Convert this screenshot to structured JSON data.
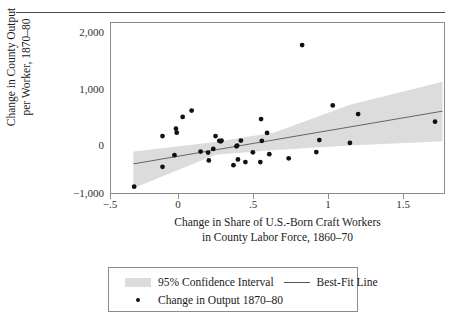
{
  "chart_data": {
    "type": "scatter",
    "title": "",
    "xlabel": "Change in Share of U.S.-Born Craft Workers in County Labor Force, 1860–70",
    "xlabel_line1": "Change in Share of U.S.-Born Craft Workers",
    "xlabel_line2": "in County Labor Force, 1860–70",
    "ylabel": "Change in County Output per Worker, 1870–80",
    "ylabel_line1": "Change in County Output",
    "ylabel_line2": "per Worker, 1870–80",
    "xlim": [
      -0.5,
      1.73
    ],
    "ylim": [
      -1120,
      2120
    ],
    "xticks": [
      -0.5,
      0,
      0.5,
      1,
      1.5
    ],
    "xticklabels": [
      "−.5",
      "0",
      ".5",
      "1",
      "1.5"
    ],
    "yticks": [
      -1000,
      0,
      1000,
      2000
    ],
    "yticklabels": [
      "−1,000",
      "0",
      "1,000",
      "2,000"
    ],
    "grid": false,
    "legend_position": "below-axes",
    "marker_color": "#111111",
    "band_color": "#dcdcdc",
    "line_color": "#555555",
    "frame_color": "#8c8c8c",
    "points": [
      {
        "x": -0.345,
        "y": -1000
      },
      {
        "x": -0.155,
        "y": -620
      },
      {
        "x": -0.155,
        "y": -35
      },
      {
        "x": -0.075,
        "y": -400
      },
      {
        "x": -0.065,
        "y": 105
      },
      {
        "x": -0.06,
        "y": 30
      },
      {
        "x": -0.02,
        "y": 330
      },
      {
        "x": 0.04,
        "y": 450
      },
      {
        "x": 0.1,
        "y": -330
      },
      {
        "x": 0.15,
        "y": -350
      },
      {
        "x": 0.155,
        "y": -500
      },
      {
        "x": 0.185,
        "y": -280
      },
      {
        "x": 0.2,
        "y": -35
      },
      {
        "x": 0.225,
        "y": -125
      },
      {
        "x": 0.235,
        "y": -135
      },
      {
        "x": 0.24,
        "y": -120
      },
      {
        "x": 0.32,
        "y": -590
      },
      {
        "x": 0.34,
        "y": -230
      },
      {
        "x": 0.345,
        "y": -215
      },
      {
        "x": 0.35,
        "y": -480
      },
      {
        "x": 0.37,
        "y": -120
      },
      {
        "x": 0.4,
        "y": -530
      },
      {
        "x": 0.45,
        "y": -345
      },
      {
        "x": 0.5,
        "y": -530
      },
      {
        "x": 0.505,
        "y": 290
      },
      {
        "x": 0.51,
        "y": -125
      },
      {
        "x": 0.545,
        "y": 25
      },
      {
        "x": 0.56,
        "y": -380
      },
      {
        "x": 0.69,
        "y": -460
      },
      {
        "x": 0.78,
        "y": 1700
      },
      {
        "x": 0.875,
        "y": -340
      },
      {
        "x": 0.895,
        "y": -110
      },
      {
        "x": 0.985,
        "y": 550
      },
      {
        "x": 1.1,
        "y": -165
      },
      {
        "x": 1.155,
        "y": 385
      },
      {
        "x": 1.67,
        "y": 240
      }
    ],
    "fit_line": {
      "x0": -0.35,
      "y0": -565,
      "x1": 1.72,
      "y1": 440
    },
    "confidence_band": {
      "upper": [
        [
          -0.35,
          -330
        ],
        [
          0.2,
          -150
        ],
        [
          0.6,
          40
        ],
        [
          1.1,
          560
        ],
        [
          1.72,
          1000
        ]
      ],
      "lower": [
        [
          -0.35,
          -1030
        ],
        [
          0.2,
          -390
        ],
        [
          0.6,
          -300
        ],
        [
          1.1,
          -215
        ],
        [
          1.72,
          -135
        ]
      ]
    }
  },
  "legend": {
    "band_label": "95% Confidence Interval",
    "line_label": "Best-Fit Line",
    "point_label": "Change in Output 1870–80"
  }
}
